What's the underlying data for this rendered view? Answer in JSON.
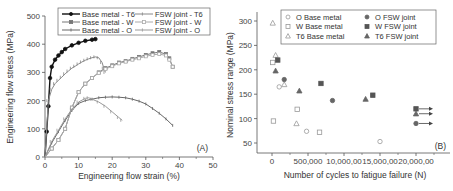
{
  "chart_data": [
    {
      "id": "A",
      "type": "line",
      "panel_label": "(A)",
      "xlabel": "Engineering flow strain (%)",
      "ylabel": "Engineering flow stress (MPa)",
      "xlim": [
        0,
        50
      ],
      "ylim": [
        0,
        500
      ],
      "xticks": [
        "0",
        "10",
        "20",
        "30",
        "40",
        "50"
      ],
      "yticks": [
        "0",
        "100",
        "200",
        "300",
        "400",
        "500"
      ],
      "grid": false,
      "legend_position": "top",
      "series": [
        {
          "name": "Base metal - T6",
          "color": "#111111",
          "marker": "filled-circle",
          "x": [
            0,
            0.5,
            1,
            1.5,
            2,
            3,
            4,
            5,
            6,
            8,
            10,
            12,
            14,
            15
          ],
          "y": [
            0,
            90,
            180,
            280,
            320,
            345,
            360,
            372,
            383,
            396,
            405,
            412,
            416,
            418
          ]
        },
        {
          "name": "Base metal - W",
          "color": "#777777",
          "marker": "filled-square",
          "x": [
            0,
            2,
            4,
            6,
            8,
            10,
            12,
            14,
            16,
            18,
            20,
            22,
            24,
            26,
            28,
            30,
            32,
            34,
            36,
            37,
            38
          ],
          "y": [
            0,
            30,
            60,
            100,
            175,
            230,
            260,
            280,
            300,
            315,
            325,
            335,
            340,
            348,
            355,
            362,
            368,
            372,
            365,
            350,
            320
          ]
        },
        {
          "name": "Base metal - O",
          "color": "#666666",
          "marker": "plus",
          "x": [
            0,
            2,
            4,
            6,
            8,
            10,
            12,
            14,
            16,
            18,
            20,
            22,
            24,
            26,
            28,
            30,
            32,
            34,
            36,
            38
          ],
          "y": [
            0,
            50,
            90,
            130,
            165,
            190,
            200,
            205,
            210,
            212,
            213,
            212,
            210,
            205,
            198,
            188,
            172,
            155,
            135,
            112
          ]
        },
        {
          "name": "FSW joint - T6",
          "color": "#888888",
          "marker": "open-circle-line",
          "x": [
            0,
            1,
            2,
            3,
            4,
            5,
            6,
            7,
            8,
            9,
            10,
            11,
            12,
            13,
            14,
            15,
            16,
            17,
            17.5,
            18
          ],
          "y": [
            0,
            200,
            240,
            260,
            272,
            283,
            295,
            305,
            315,
            322,
            330,
            337,
            343,
            348,
            352,
            355,
            352,
            335,
            315,
            300
          ]
        },
        {
          "name": "FSW joint - W",
          "color": "#aaaaaa",
          "marker": "open-square",
          "x": [
            0,
            2,
            4,
            6,
            8,
            10,
            12,
            14,
            16,
            18,
            20,
            22,
            24,
            26,
            28,
            30,
            32,
            34,
            36,
            37,
            38
          ],
          "y": [
            0,
            30,
            60,
            100,
            175,
            230,
            260,
            280,
            298,
            312,
            322,
            332,
            338,
            345,
            350,
            357,
            362,
            365,
            360,
            345,
            320
          ]
        },
        {
          "name": "FSW joint - O",
          "color": "#999999",
          "marker": "left-tick",
          "x": [
            0,
            2,
            4,
            6,
            8,
            10,
            12,
            13,
            14,
            16,
            18,
            20,
            22,
            23
          ],
          "y": [
            0,
            55,
            95,
            135,
            170,
            195,
            208,
            210,
            205,
            195,
            180,
            160,
            140,
            130
          ]
        }
      ]
    },
    {
      "id": "B",
      "type": "scatter",
      "panel_label": "(B)",
      "xlabel": "Number of cycles to fatigue failure (N)",
      "ylabel": "Nominal stress range (MPa)",
      "xlim": [
        -200000,
        2300000
      ],
      "ylim": [
        30,
        320
      ],
      "xticks": [
        "0",
        "500,000",
        "10,000,00",
        "15,000,00",
        "20,000,00"
      ],
      "yticks": [
        "50",
        "100",
        "150",
        "200",
        "250",
        "300"
      ],
      "grid": false,
      "legend_position": "top",
      "series": [
        {
          "name": "O Base metal",
          "marker": "open-circle",
          "color": "#999999",
          "points": [
            [
              100000,
              165
            ],
            [
              480000,
              74
            ],
            [
              1500000,
              53
            ]
          ]
        },
        {
          "name": "W Base metal",
          "marker": "open-square",
          "color": "#999999",
          "points": [
            [
              10000,
              215
            ],
            [
              20000,
              95
            ],
            [
              350000,
              119
            ],
            [
              660000,
              72
            ]
          ]
        },
        {
          "name": "T6 Base metal",
          "marker": "open-triangle",
          "color": "#999999",
          "points": [
            [
              10000,
              296
            ],
            [
              50000,
              230
            ],
            [
              170000,
              170
            ],
            [
              340000,
              90
            ]
          ]
        },
        {
          "name": "O FSW joint",
          "marker": "filled-circle",
          "color": "#666666",
          "points": [
            [
              170000,
              180
            ],
            [
              840000,
              137
            ],
            [
              2000000,
              90
            ]
          ],
          "runout": [
            false,
            false,
            true
          ]
        },
        {
          "name": "W FSW joint",
          "marker": "filled-square",
          "color": "#555555",
          "points": [
            [
              80000,
              220
            ],
            [
              680000,
              172
            ],
            [
              1400000,
              148
            ],
            [
              2000000,
              120
            ]
          ],
          "runout": [
            false,
            false,
            false,
            true
          ]
        },
        {
          "name": "T6 FSW joint",
          "marker": "filled-triangle",
          "color": "#666666",
          "points": [
            [
              50000,
              198
            ],
            [
              380000,
              157
            ],
            [
              1300000,
              140
            ],
            [
              2000000,
              110
            ]
          ],
          "runout": [
            false,
            false,
            false,
            true
          ]
        }
      ]
    }
  ],
  "panelA": {
    "label": "(A)",
    "xlabel": "Engineering flow strain (%)",
    "ylabel": "Engineering flow stress (MPa)",
    "xticks": [
      "0",
      "10",
      "20",
      "30",
      "40",
      "50"
    ],
    "yticks": [
      "0",
      "100",
      "200",
      "300",
      "400",
      "500"
    ],
    "legend": [
      "Base metal - T6",
      "Base metal - W",
      "Base metal - O",
      "FSW joint - T6",
      "FSW joint - W",
      "FSW joint - O"
    ]
  },
  "panelB": {
    "label": "(B)",
    "xlabel": "Number of cycles to fatigue failure (N)",
    "ylabel": "Nominal stress range (MPa)",
    "xticks": [
      "0",
      "500,000",
      "10,000,00",
      "15,000,00",
      "20,000,00"
    ],
    "yticks": [
      "50",
      "100",
      "150",
      "200",
      "250",
      "300"
    ],
    "legend": [
      "O Base metal",
      "W Base metal",
      "T6 Base metal",
      "O FSW joint",
      "W FSW joint",
      "T6 FSW joint"
    ]
  }
}
